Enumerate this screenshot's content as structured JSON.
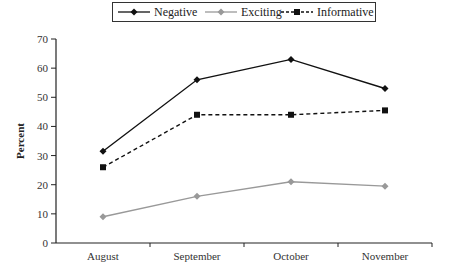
{
  "chart_data": {
    "type": "line",
    "title": "",
    "xlabel": "",
    "ylabel": "Percent",
    "ylim": [
      0,
      70
    ],
    "yticks": [
      0,
      10,
      20,
      30,
      40,
      50,
      60,
      70
    ],
    "grid": false,
    "legend_position": "top",
    "categories": [
      "August",
      "September",
      "October",
      "November"
    ],
    "series": [
      {
        "name": "Negative",
        "values": [
          31.5,
          56,
          63,
          53
        ],
        "color": "#111111",
        "line": "solid",
        "marker": "diamond"
      },
      {
        "name": "Exciting",
        "values": [
          9,
          16,
          21,
          19.5
        ],
        "color": "#999999",
        "line": "solid",
        "marker": "diamond"
      },
      {
        "name": "Informative",
        "values": [
          26,
          44,
          44,
          45.5
        ],
        "color": "#111111",
        "line": "dashed",
        "marker": "square"
      }
    ]
  },
  "legend": {
    "items": [
      {
        "label": "Negative"
      },
      {
        "label": "Exciting"
      },
      {
        "label": "Informative"
      }
    ]
  },
  "axis": {
    "ylabel": "Percent",
    "ytick_labels": [
      "0",
      "10",
      "20",
      "30",
      "40",
      "50",
      "60",
      "70"
    ],
    "xtick_labels": [
      "August",
      "September",
      "October",
      "November"
    ]
  }
}
